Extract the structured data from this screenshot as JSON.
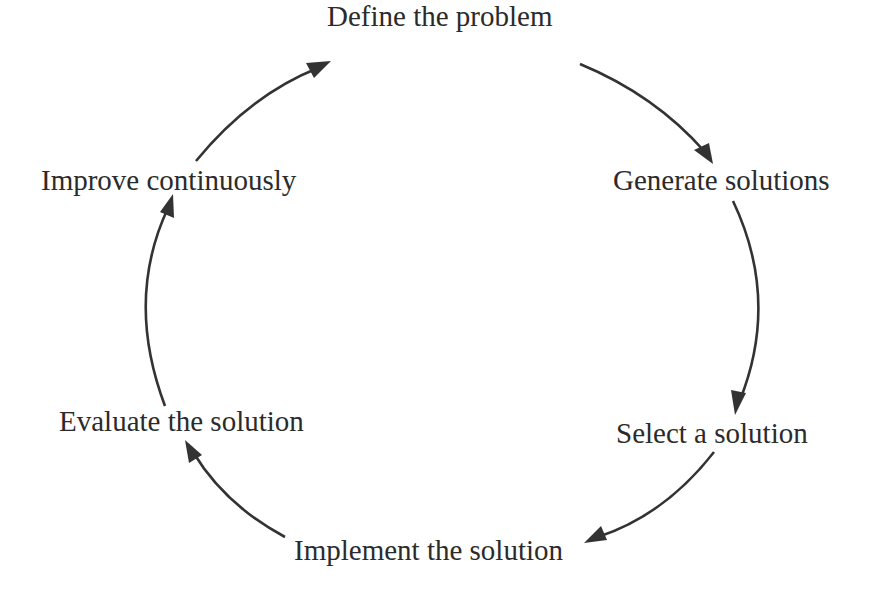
{
  "diagram": {
    "type": "cycle",
    "colors": {
      "text": "#2b2b2b",
      "arrow": "#333333",
      "background": "#ffffff"
    },
    "steps": [
      {
        "label": "Define the problem"
      },
      {
        "label": "Generate solutions"
      },
      {
        "label": "Select a solution"
      },
      {
        "label": "Implement the solution"
      },
      {
        "label": "Evaluate the solution"
      },
      {
        "label": "Improve continuously"
      }
    ],
    "edges": [
      {
        "from": "Define the problem",
        "to": "Generate solutions"
      },
      {
        "from": "Generate solutions",
        "to": "Select a solution"
      },
      {
        "from": "Select a solution",
        "to": "Implement the solution"
      },
      {
        "from": "Implement the solution",
        "to": "Evaluate the solution"
      },
      {
        "from": "Evaluate the solution",
        "to": "Improve continuously"
      },
      {
        "from": "Improve continuously",
        "to": "Define the problem"
      }
    ]
  }
}
